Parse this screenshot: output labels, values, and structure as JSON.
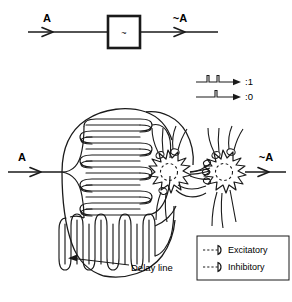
{
  "figure": {
    "title_top": "",
    "top_block_diagram": {
      "input_label": "A",
      "output_label": "~A",
      "box_symbol": "~",
      "box_name": "inverter-box",
      "input_arrow_icon": "arrow-right-icon",
      "output_arrow_icon": "arrow-right-icon"
    },
    "pulse_legend": {
      "items": [
        {
          "label": ":1",
          "pulses": 2,
          "icon": "pulse-train-two-icon"
        },
        {
          "label": ":0",
          "pulses": 1,
          "icon": "pulse-train-one-icon"
        }
      ]
    },
    "network": {
      "input_label": "A",
      "output_label": "~A",
      "annotation_label": "Delay line",
      "annotation_icon": "leader-arrow-icon",
      "upper_coil_name": "upper-delay-coil",
      "lower_coil_name": "lower-delay-coil",
      "neuron_left_name": "neuron-left",
      "neuron_right_name": "neuron-right"
    },
    "synapse_legend": {
      "items": [
        {
          "label": "Excitatory",
          "icon": "excitatory-synapse-icon"
        },
        {
          "label": "Inhibitory",
          "icon": "inhibitory-synapse-icon"
        }
      ]
    },
    "colors": {
      "ink": "#1a1a1a",
      "background": "#ffffff"
    }
  }
}
